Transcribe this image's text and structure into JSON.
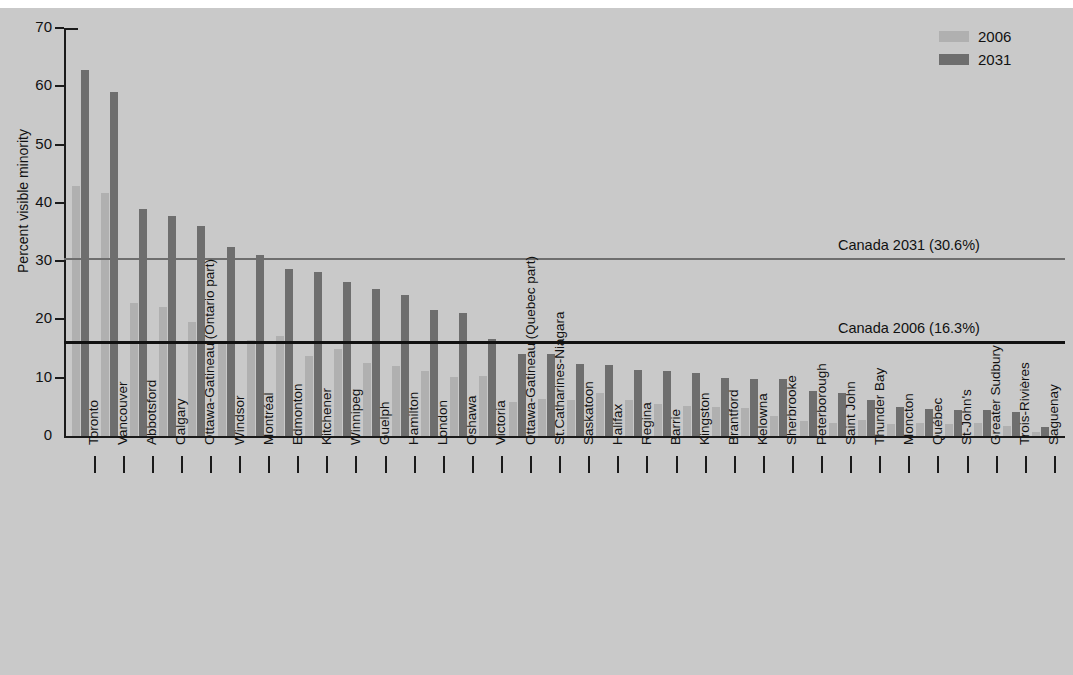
{
  "chart_data": {
    "type": "bar",
    "title": "",
    "xlabel": "",
    "ylabel": "Percent visible minority",
    "ylim": [
      0,
      70
    ],
    "yticks": [
      0,
      10,
      20,
      30,
      40,
      50,
      60,
      70
    ],
    "grid": false,
    "legend_position": "top-right",
    "categories": [
      "Toronto",
      "Vancouver",
      "Abbotsford",
      "Calgary",
      "Ottawa-Gatineau (Ontario part)",
      "Windsor",
      "Montréal",
      "Edmonton",
      "Kitchener",
      "Winnipeg",
      "Guelph",
      "Hamilton",
      "London",
      "Oshawa",
      "Victoria",
      "Ottawa-Gatineau (Quebec part)",
      "St.Catharines-Niagara",
      "Saskatoon",
      "Halifax",
      "Regina",
      "Barrie",
      "Kingston",
      "Brantford",
      "Kelowna",
      "Sherbrooke",
      "Peterborough",
      "Saint John",
      "Thunder Bay",
      "Moncton",
      "Québec",
      "St-John's",
      "Greater Sudbury",
      "Trois-Rivières",
      "Saguenay"
    ],
    "series": [
      {
        "name": "2006",
        "color": "#b0b0b0",
        "values": [
          42.9,
          41.7,
          22.8,
          22.2,
          19.5,
          15.9,
          16.5,
          17.1,
          13.8,
          15.0,
          12.6,
          12.0,
          11.1,
          10.2,
          10.3,
          5.8,
          6.4,
          6.2,
          7.3,
          6.2,
          5.5,
          5.2,
          5.0,
          4.8,
          3.5,
          2.6,
          2.3,
          2.8,
          2.1,
          2.2,
          2.0,
          2.2,
          1.8,
          0.7
        ]
      },
      {
        "name": "2031",
        "color": "#6e6e6e",
        "values": [
          62.8,
          59.1,
          38.9,
          37.7,
          36.1,
          32.5,
          31.0,
          28.6,
          28.2,
          26.5,
          25.2,
          24.2,
          21.7,
          21.1,
          16.7,
          14.1,
          14.1,
          12.4,
          12.1,
          11.4,
          11.2,
          10.8,
          9.9,
          9.8,
          9.7,
          7.8,
          7.4,
          6.2,
          4.9,
          4.7,
          4.4,
          4.5,
          4.2,
          1.5
        ]
      }
    ],
    "reference_lines": [
      {
        "label": "Canada 2031 (30.6%)",
        "value": 30.6,
        "color": "#6e6e6e"
      },
      {
        "label": "Canada 2006 (16.3%)",
        "value": 16.3,
        "color": "#111111"
      }
    ]
  },
  "legend": {
    "items": [
      {
        "label": "2006"
      },
      {
        "label": "2031"
      }
    ]
  }
}
